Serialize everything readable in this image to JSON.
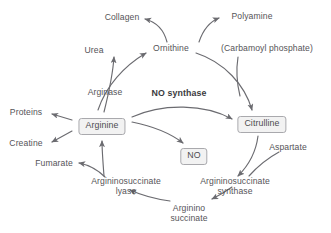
{
  "diagram": {
    "accent_color": "#6b6b70",
    "box_fill": "#f2f2f2",
    "box_border": "#a9a9ad",
    "text_color": "#555458",
    "background": "#ffffff",
    "nodes": [
      {
        "id": "collagen",
        "label": "Collagen",
        "kind": "metabolite",
        "boxed": false
      },
      {
        "id": "polyamine",
        "label": "Polyamine",
        "kind": "metabolite",
        "boxed": false
      },
      {
        "id": "urea",
        "label": "Urea",
        "kind": "metabolite",
        "boxed": false
      },
      {
        "id": "ornithine",
        "label": "Ornithine",
        "kind": "metabolite",
        "boxed": false
      },
      {
        "id": "carbamoyl",
        "label": "(Carbamoyl phosphate)",
        "kind": "metabolite",
        "boxed": false
      },
      {
        "id": "arginase",
        "label": "Arginase",
        "kind": "enzyme",
        "boxed": false
      },
      {
        "id": "nosynthase",
        "label": "NO synthase",
        "kind": "enzyme",
        "boxed": false,
        "bold": true
      },
      {
        "id": "proteins",
        "label": "Proteins",
        "kind": "metabolite",
        "boxed": false
      },
      {
        "id": "creatine",
        "label": "Creatine",
        "kind": "metabolite",
        "boxed": false
      },
      {
        "id": "arginine",
        "label": "Arginine",
        "kind": "metabolite",
        "boxed": true
      },
      {
        "id": "citrulline",
        "label": "Citrulline",
        "kind": "metabolite",
        "boxed": true
      },
      {
        "id": "no",
        "label": "NO",
        "kind": "metabolite",
        "boxed": true
      },
      {
        "id": "aspartate",
        "label": "Aspartate",
        "kind": "metabolite",
        "boxed": false
      },
      {
        "id": "fumarate",
        "label": "Fumarate",
        "kind": "metabolite",
        "boxed": false
      },
      {
        "id": "aslyase_l1",
        "label": "Argininosuccinate",
        "kind": "enzyme",
        "boxed": false
      },
      {
        "id": "aslyase_l2",
        "label": "lyase",
        "kind": "enzyme",
        "boxed": false
      },
      {
        "id": "assyn_l1",
        "label": "Argininosuccinate",
        "kind": "enzyme",
        "boxed": false
      },
      {
        "id": "assyn_l2",
        "label": "synthase",
        "kind": "enzyme",
        "boxed": false
      },
      {
        "id": "argsucc_l1",
        "label": "Arginino",
        "kind": "metabolite",
        "boxed": false
      },
      {
        "id": "argsucc_l2",
        "label": "succinate",
        "kind": "metabolite",
        "boxed": false
      }
    ],
    "edges": [
      {
        "from": "ornithine",
        "to": "collagen",
        "arrow": true
      },
      {
        "from": "ornithine",
        "to": "polyamine",
        "arrow": true
      },
      {
        "from": "arginine",
        "to": "urea",
        "arrow": true
      },
      {
        "from": "arginine",
        "to": "ornithine",
        "arrow": true
      },
      {
        "from": "ornithine",
        "to": "citrulline",
        "arrow": true
      },
      {
        "from": "carbamoyl",
        "to": "citrulline",
        "arrow": false
      },
      {
        "from": "arginine",
        "to": "citrulline",
        "arrow": true
      },
      {
        "from": "arginine",
        "to": "no",
        "arrow": true
      },
      {
        "from": "arginine",
        "to": "proteins",
        "arrow": true
      },
      {
        "from": "arginine",
        "to": "creatine",
        "arrow": true
      },
      {
        "from": "citrulline",
        "to": "argsucc",
        "arrow": true
      },
      {
        "from": "aspartate",
        "to": "argsucc",
        "arrow": false
      },
      {
        "from": "argsucc",
        "to": "arginine",
        "arrow": true
      },
      {
        "from": "argsucc",
        "to": "fumarate",
        "arrow": true
      }
    ]
  }
}
